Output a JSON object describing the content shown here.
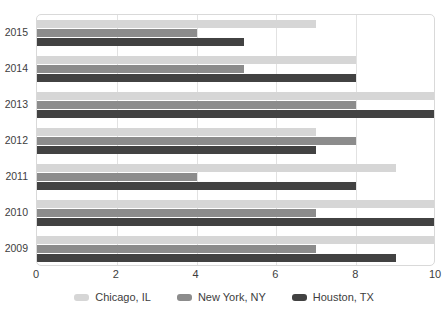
{
  "chart_data": {
    "type": "bar",
    "orientation": "horizontal",
    "title": "",
    "xlabel": "",
    "ylabel": "",
    "categories": [
      "2015",
      "2014",
      "2013",
      "2012",
      "2011",
      "2010",
      "2009"
    ],
    "series": [
      {
        "name": "Chicago, IL",
        "color": "#d6d6d6",
        "values": [
          7,
          8,
          10,
          7,
          9,
          10,
          10
        ]
      },
      {
        "name": "New York, NY",
        "color": "#8c8c8c",
        "values": [
          4,
          5.2,
          8,
          8,
          4,
          7,
          7
        ]
      },
      {
        "name": "Houston, TX",
        "color": "#424242",
        "values": [
          5.2,
          8,
          10,
          7,
          8,
          10,
          9
        ]
      }
    ],
    "xlim": [
      0,
      10
    ],
    "x_ticks": [
      "0",
      "2",
      "4",
      "6",
      "8",
      "10"
    ],
    "x_tick_values": [
      0,
      2,
      4,
      6,
      8,
      10
    ],
    "grid": true,
    "legend_position": "bottom"
  },
  "axes": {
    "x_ticks": [
      "0",
      "2",
      "4",
      "6",
      "8",
      "10"
    ],
    "y_ticks": [
      "2015",
      "2014",
      "2013",
      "2012",
      "2011",
      "2010",
      "2009"
    ]
  },
  "legend": {
    "items": [
      {
        "label": "Chicago, IL",
        "color": "#d6d6d6"
      },
      {
        "label": "New York, NY",
        "color": "#8c8c8c"
      },
      {
        "label": "Houston, TX",
        "color": "#424242"
      }
    ]
  }
}
